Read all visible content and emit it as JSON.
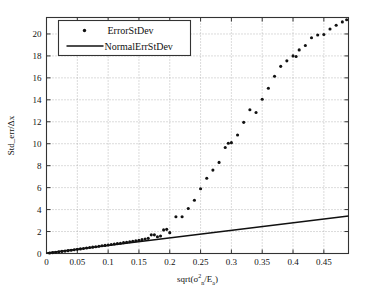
{
  "chart_data": {
    "type": "scatter",
    "title": "",
    "xlabel": "sqrt(σ²ₙ/Eₐ)",
    "ylabel": "Std_err/Δx",
    "xlim": [
      0,
      0.49
    ],
    "ylim": [
      0,
      21.5
    ],
    "xticks": [
      0,
      0.05,
      0.1,
      0.15,
      0.2,
      0.25,
      0.3,
      0.35,
      0.4,
      0.45
    ],
    "xticklabels": [
      "0",
      "0.05",
      "0.1",
      "0.15",
      "0.2",
      "0.25",
      "0.3",
      "0.35",
      "0.4",
      "0.45"
    ],
    "yticks": [
      0,
      2,
      4,
      6,
      8,
      10,
      12,
      14,
      16,
      18,
      20
    ],
    "yticklabels": [
      "0",
      "2",
      "4",
      "6",
      "8",
      "10",
      "12",
      "14",
      "16",
      "18",
      "20"
    ],
    "grid": true,
    "legend_position": "upper left",
    "series": [
      {
        "name": "ErrorStDev",
        "marker": "dot",
        "style": "scatter",
        "points": [
          [
            0.005,
            0.04
          ],
          [
            0.01,
            0.08
          ],
          [
            0.015,
            0.11
          ],
          [
            0.02,
            0.15
          ],
          [
            0.025,
            0.19
          ],
          [
            0.03,
            0.22
          ],
          [
            0.035,
            0.26
          ],
          [
            0.04,
            0.3
          ],
          [
            0.045,
            0.34
          ],
          [
            0.05,
            0.38
          ],
          [
            0.055,
            0.42
          ],
          [
            0.06,
            0.46
          ],
          [
            0.065,
            0.5
          ],
          [
            0.07,
            0.54
          ],
          [
            0.075,
            0.58
          ],
          [
            0.08,
            0.62
          ],
          [
            0.085,
            0.66
          ],
          [
            0.09,
            0.7
          ],
          [
            0.095,
            0.74
          ],
          [
            0.1,
            0.78
          ],
          [
            0.105,
            0.82
          ],
          [
            0.11,
            0.86
          ],
          [
            0.115,
            0.9
          ],
          [
            0.12,
            0.94
          ],
          [
            0.125,
            0.99
          ],
          [
            0.13,
            1.03
          ],
          [
            0.135,
            1.07
          ],
          [
            0.14,
            1.12
          ],
          [
            0.145,
            1.16
          ],
          [
            0.15,
            1.21
          ],
          [
            0.155,
            1.26
          ],
          [
            0.16,
            1.32
          ],
          [
            0.165,
            1.38
          ],
          [
            0.17,
            1.7
          ],
          [
            0.175,
            1.7
          ],
          [
            0.18,
            1.52
          ],
          [
            0.185,
            1.6
          ],
          [
            0.19,
            2.15
          ],
          [
            0.195,
            2.2
          ],
          [
            0.2,
            1.9
          ],
          [
            0.21,
            3.35
          ],
          [
            0.22,
            3.35
          ],
          [
            0.23,
            4.1
          ],
          [
            0.24,
            4.85
          ],
          [
            0.25,
            5.9
          ],
          [
            0.26,
            6.85
          ],
          [
            0.27,
            7.6
          ],
          [
            0.28,
            8.3
          ],
          [
            0.29,
            9.65
          ],
          [
            0.295,
            10.05
          ],
          [
            0.3,
            10.1
          ],
          [
            0.31,
            10.8
          ],
          [
            0.32,
            11.95
          ],
          [
            0.33,
            13.1
          ],
          [
            0.34,
            12.85
          ],
          [
            0.35,
            14.05
          ],
          [
            0.36,
            15.05
          ],
          [
            0.37,
            16.15
          ],
          [
            0.38,
            17.05
          ],
          [
            0.39,
            17.55
          ],
          [
            0.4,
            18.0
          ],
          [
            0.405,
            17.95
          ],
          [
            0.41,
            18.55
          ],
          [
            0.42,
            18.95
          ],
          [
            0.43,
            19.65
          ],
          [
            0.44,
            19.9
          ],
          [
            0.45,
            19.95
          ],
          [
            0.46,
            20.45
          ],
          [
            0.47,
            20.8
          ],
          [
            0.48,
            21.1
          ],
          [
            0.487,
            21.3
          ]
        ]
      },
      {
        "name": "NormalErrStDev",
        "marker": "none",
        "style": "line",
        "slope": 7.0,
        "intercept": 0.0,
        "points": [
          [
            0.0,
            0.05
          ],
          [
            0.49,
            3.42
          ]
        ]
      }
    ]
  },
  "legend": {
    "entries": [
      {
        "label": "ErrorStDev",
        "marker": "dot"
      },
      {
        "label": "NormalErrStDev",
        "marker": "line"
      }
    ]
  },
  "axis_label_parts": {
    "x_prefix": "sqrt(",
    "x_sigma": "σ",
    "x_sigma_sup": "2",
    "x_sigma_sub": "n",
    "x_slash": "/E",
    "x_e_sub": "a",
    "x_suffix": ")",
    "y_full": "Std_err/Δx"
  }
}
